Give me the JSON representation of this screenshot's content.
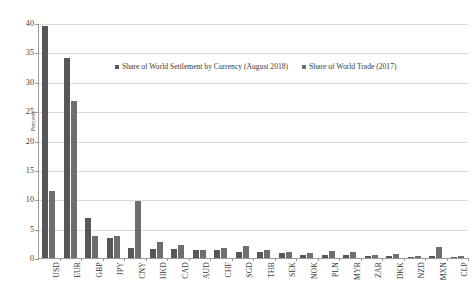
{
  "chart_data": {
    "type": "bar",
    "title": "",
    "xlabel": "",
    "ylabel": "Percent",
    "ylim": [
      0,
      40
    ],
    "yticks": [
      0,
      5,
      10,
      15,
      20,
      25,
      30,
      35,
      40
    ],
    "grid": true,
    "legend_position": "top-center",
    "categories": [
      "USD",
      "EUR",
      "GBP",
      "JPY",
      "CNY",
      "HKD",
      "CAD",
      "AUD",
      "CHF",
      "SGD",
      "THB",
      "SEK",
      "NOK",
      "PLN",
      "MYR",
      "ZAR",
      "DKK",
      "NZD",
      "MXN",
      "CLP"
    ],
    "series": [
      {
        "name": "Share of World Settlement by Currency (August 2018)",
        "color": "#575757",
        "values": [
          39.6,
          34.2,
          6.9,
          3.5,
          1.7,
          1.5,
          1.6,
          1.3,
          1.4,
          1.0,
          1.0,
          0.8,
          0.6,
          0.6,
          0.5,
          0.3,
          0.4,
          0.2,
          0.3,
          0.1
        ]
      },
      {
        "name": "Share of World Trade (2017)",
        "color": "#6e6e6e",
        "values": [
          11.5,
          26.8,
          3.7,
          3.8,
          9.8,
          2.7,
          2.3,
          1.4,
          1.7,
          2.1,
          1.3,
          1.0,
          0.8,
          1.2,
          1.0,
          0.5,
          0.7,
          0.3,
          1.8,
          0.3
        ]
      }
    ]
  },
  "axis": {
    "y_title": "Percent"
  }
}
